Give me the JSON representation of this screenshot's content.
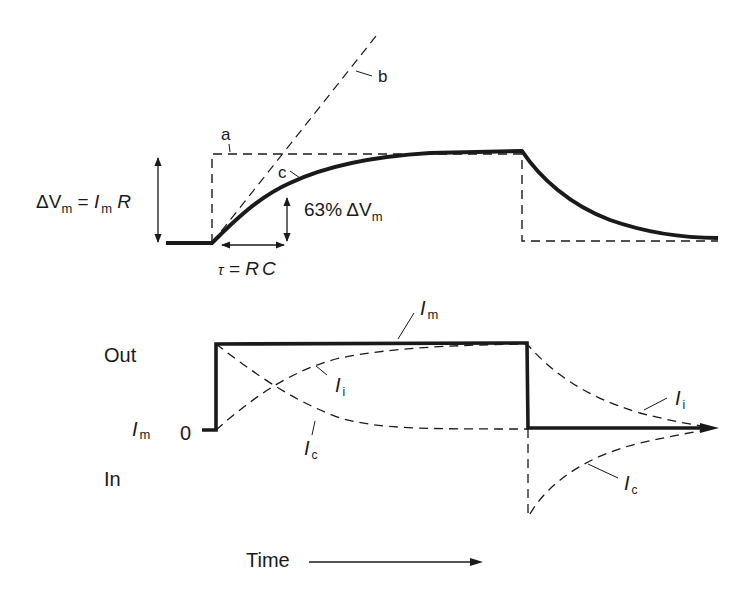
{
  "figure": {
    "top_panel": {
      "title": "Membrane potential response to current step",
      "labels": {
        "a": "a",
        "b": "b",
        "c": "c",
        "delta_vm_main": "ΔV",
        "delta_vm_sub": "m",
        "equals": " = ",
        "im_main": "I",
        "im_sub": "m",
        "r": " R",
        "pct_63": "63% ΔV",
        "pct_63_sub": "m",
        "tau": "τ",
        "tau_eq": " = ",
        "rc": "RC"
      }
    },
    "bottom_panel": {
      "labels": {
        "out": "Out",
        "in": "In",
        "im_axis_main": "I",
        "im_axis_sub": "m",
        "zero": "0",
        "im_curve_main": "I",
        "im_curve_sub": "m",
        "ii_1_main": "I",
        "ii_1_sub": "i",
        "ic_1_main": "I",
        "ic_1_sub": "c",
        "ii_2_main": "I",
        "ii_2_sub": "i",
        "ic_2_main": "I",
        "ic_2_sub": "c"
      }
    },
    "time_axis": {
      "label": "Time"
    },
    "colors": {
      "ink": "#1a1a1a",
      "background": "#ffffff"
    }
  }
}
